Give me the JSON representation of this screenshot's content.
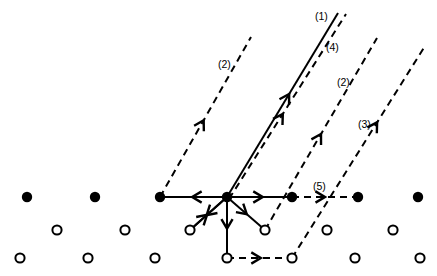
{
  "figure": {
    "title": "",
    "width": 437,
    "height": 276,
    "background_color": "#ffffff",
    "ink_color": "#000000"
  },
  "lattice": {
    "filled_marker_radius": 5.2,
    "open_marker_radius": 4.6,
    "open_marker_stroke": 2.0,
    "rows": [
      {
        "name": "row-top-filled",
        "marker": "filled-circle",
        "y": 197,
        "x": [
          27,
          95,
          160,
          227,
          292,
          358,
          418
        ]
      },
      {
        "name": "row-middle-open",
        "marker": "open-circle",
        "y": 230,
        "x": [
          57,
          125,
          190,
          265,
          327,
          393
        ]
      },
      {
        "name": "row-bottom-open",
        "marker": "open-circle",
        "y": 258,
        "x": [
          20,
          88,
          155,
          227,
          292,
          355,
          420
        ]
      }
    ]
  },
  "hub": {
    "name": "central-node",
    "x": 227,
    "y": 197
  },
  "labels": [
    {
      "id": "label-1",
      "text": "(1)",
      "x": 315,
      "y": 20
    },
    {
      "id": "label-4",
      "text": "(4)",
      "x": 326,
      "y": 51
    },
    {
      "id": "label-2-left",
      "text": "(2)",
      "x": 218,
      "y": 68
    },
    {
      "id": "label-2-right",
      "text": "(2)",
      "x": 337,
      "y": 86
    },
    {
      "id": "label-3",
      "text": "(3)",
      "x": 358,
      "y": 128
    },
    {
      "id": "label-5",
      "text": "(5)",
      "x": 313,
      "y": 190
    }
  ],
  "vectors": [
    {
      "id": "vector-1",
      "label": "(1)",
      "style": "solid",
      "x1": 227,
      "y1": 197,
      "x2": 338,
      "y2": 13,
      "arrow_at": 0.56
    },
    {
      "id": "vector-4",
      "label": "(4)",
      "style": "dashed",
      "x1": 229,
      "y1": 199,
      "x2": 346,
      "y2": 14,
      "arrow_at": 0.46
    },
    {
      "id": "vector-2-left",
      "label": "(2)",
      "style": "dashed",
      "x1": 160,
      "y1": 197,
      "x2": 251,
      "y2": 37,
      "arrow_at": 0.48
    },
    {
      "id": "vector-2-right",
      "label": "(2)",
      "style": "dashed",
      "x1": 265,
      "y1": 230,
      "x2": 377,
      "y2": 38,
      "arrow_at": 0.5
    },
    {
      "id": "vector-3",
      "label": "(3)",
      "style": "dashed",
      "x1": 292,
      "y1": 258,
      "x2": 425,
      "y2": 46,
      "arrow_at": 0.64
    },
    {
      "id": "vector-5",
      "label": "(5)",
      "style": "dashed",
      "x1": 292,
      "y1": 197,
      "x2": 358,
      "y2": 197,
      "arrow_at": 0.5
    },
    {
      "id": "vector-hub-left",
      "label": "",
      "style": "solid",
      "x1": 227,
      "y1": 197,
      "x2": 160,
      "y2": 197,
      "arrow_at": 0.52
    },
    {
      "id": "vector-hub-right",
      "label": "",
      "style": "solid",
      "x1": 227,
      "y1": 197,
      "x2": 292,
      "y2": 197,
      "arrow_at": 0.55
    },
    {
      "id": "vector-hub-down",
      "label": "",
      "style": "solid",
      "x1": 227,
      "y1": 197,
      "x2": 227,
      "y2": 258,
      "arrow_at": 0.52
    },
    {
      "id": "vector-hub-down-left",
      "label": "",
      "style": "solid",
      "x1": 227,
      "y1": 197,
      "x2": 190,
      "y2": 230,
      "arrow_at": 0.55
    },
    {
      "id": "vector-hub-down-right",
      "label": "",
      "style": "solid",
      "x1": 227,
      "y1": 197,
      "x2": 265,
      "y2": 230,
      "arrow_at": 0.52
    },
    {
      "id": "vector-reverse-up-right",
      "label": "",
      "style": "solid",
      "x1": 190,
      "y1": 230,
      "x2": 227,
      "y2": 197,
      "arrow_at": 0.46
    },
    {
      "id": "vector-bottom-dashed",
      "label": "",
      "style": "dashed",
      "x1": 227,
      "y1": 258,
      "x2": 292,
      "y2": 258,
      "arrow_at": 0.52
    }
  ]
}
